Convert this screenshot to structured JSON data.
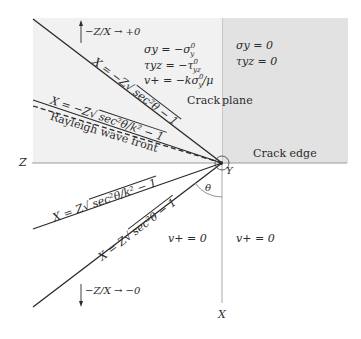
{
  "figure": {
    "axes": {
      "z_label": "Z",
      "x_label": "X",
      "origin_label": "Y",
      "angle_label": "θ"
    },
    "regions": {
      "upper_left": {
        "equations": [
          "σ_y = −σ_y^0",
          "τ_yz = −τ_yz^0",
          "v_+ = −kσ_y^0/μ"
        ],
        "eq1": "σy = −σ",
        "eq1_sup": "0",
        "eq1_sub": "y",
        "eq2": "τyz = −τ",
        "eq2_sup": "0",
        "eq2_sub": "yz",
        "eq3": "v+ = −kσ",
        "eq3_sup": "0",
        "eq3_sub": "y",
        "eq3_tail": "/μ",
        "label": "Crack"
      },
      "upper_right": {
        "eq1": "σy = 0",
        "eq2": "τyz = 0",
        "label_plane": "plane",
        "label_edge": "Crack edge"
      },
      "lower_left": {
        "eq": "v+ = 0"
      },
      "lower_right": {
        "eq": "v+ = 0"
      }
    },
    "arrows": {
      "top": "−Z/X → +0",
      "bottom": "−Z/X → −0"
    },
    "lines": [
      {
        "id": "upper-shear",
        "label_pre": "X = −Z",
        "label_root": "sec²θ − 1"
      },
      {
        "id": "upper-dilatational",
        "label_pre": "X = −Z",
        "label_root": "sec²θ/k² − 1"
      },
      {
        "id": "rayleigh",
        "label": "Rayleigh wave front",
        "style": "dashed"
      },
      {
        "id": "lower-dilatational",
        "label_pre": "X = Z",
        "label_root": "sec²θ/k² − 1"
      },
      {
        "id": "lower-shear",
        "label_pre": "X = Z",
        "label_root": "sec²θ − 1"
      }
    ],
    "colors": {
      "light_region": "#f1f1f1",
      "dark_region": "#e0e0e0",
      "line": "#2a2a2a",
      "axis": "#9a9a9a"
    }
  }
}
